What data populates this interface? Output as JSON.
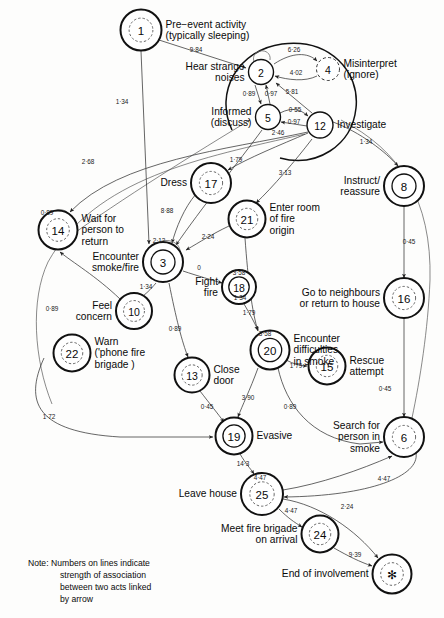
{
  "figure": {
    "note_label": "Note:",
    "note_lines": [
      "Numbers on lines indicate",
      "strength of association",
      "between two acts linked",
      "by arrow"
    ]
  },
  "nodes": [
    {
      "id": "1",
      "num": "1",
      "label": "Pre−event activity\n(typically sleeping)",
      "label_lines": [
        "Pre−event activity",
        "(typically sleeping)"
      ],
      "cx": 141,
      "cy": 30,
      "r": 20.5,
      "style": "double-dashed",
      "label_pos": "right"
    },
    {
      "id": "2",
      "num": "2",
      "label": "Hear strange noises",
      "label_lines": [
        "Hear strange",
        "noises"
      ],
      "cx": 261,
      "cy": 72,
      "r": 12.5,
      "style": "plain",
      "label_pos": "left"
    },
    {
      "id": "4",
      "num": "4",
      "label": "Misinterpret (ignore)",
      "label_lines": [
        "Misinterpret",
        "(ignore)"
      ],
      "cx": 328,
      "cy": 69,
      "r": 11.5,
      "style": "dashed",
      "label_pos": "right"
    },
    {
      "id": "5",
      "num": "5",
      "label": "Informed (discuss)",
      "label_lines": [
        "Informed",
        "(discuss)"
      ],
      "cx": 268,
      "cy": 117,
      "r": 12.5,
      "style": "plain",
      "label_pos": "left"
    },
    {
      "id": "12",
      "num": "12",
      "label": "Investigate",
      "label_lines": [
        "Investigate"
      ],
      "cx": 320,
      "cy": 125,
      "r": 13.0,
      "style": "plain",
      "label_pos": "right"
    },
    {
      "id": "8",
      "num": "8",
      "label": "Instruct/ reassure",
      "label_lines": [
        "Instruct/",
        "reassure"
      ],
      "cx": 404,
      "cy": 186,
      "r": 20.0,
      "style": "double",
      "label_pos": "left"
    },
    {
      "id": "17",
      "num": "17",
      "label": "Dress",
      "label_lines": [
        "Dress"
      ],
      "cx": 211,
      "cy": 183,
      "r": 20.0,
      "style": "double-dashed",
      "label_pos": "left"
    },
    {
      "id": "21",
      "num": "21",
      "label": "Enter room of fire origin",
      "label_lines": [
        "Enter room",
        "of  fire",
        "origin"
      ],
      "cx": 247,
      "cy": 219,
      "r": 18.5,
      "style": "double-dashed",
      "label_pos": "right"
    },
    {
      "id": "14",
      "num": "14",
      "label": "Wait for person to return",
      "label_lines": [
        "Wait for",
        "person to",
        "return"
      ],
      "cx": 58,
      "cy": 230,
      "r": 19.5,
      "style": "double-dashed",
      "label_pos": "right"
    },
    {
      "id": "3",
      "num": "3",
      "label": "Encounter smoke/fire",
      "label_lines": [
        "Encounter",
        "smoke/fire"
      ],
      "cx": 163,
      "cy": 262,
      "r": 20.0,
      "style": "double",
      "label_pos": "left"
    },
    {
      "id": "18",
      "num": "18",
      "label": "Fight fire",
      "label_lines": [
        "Fight",
        "fire"
      ],
      "cx": 239,
      "cy": 287,
      "r": 17.0,
      "style": "double",
      "label_pos": "left"
    },
    {
      "id": "10",
      "num": "10",
      "label": "Feel concern",
      "label_lines": [
        "Feel",
        "concern"
      ],
      "cx": 134,
      "cy": 311,
      "r": 18.0,
      "style": "double-dashed",
      "label_pos": "left"
    },
    {
      "id": "16",
      "num": "16",
      "label": "Go to neighbours or return to house",
      "label_lines": [
        "Go to neighbours",
        "or return  to house"
      ],
      "cx": 404,
      "cy": 298,
      "r": 20.0,
      "style": "double-dashed",
      "label_pos": "left"
    },
    {
      "id": "22",
      "num": "22",
      "label": "Warn ('phone fire brigade )",
      "label_lines": [
        "Warn",
        "('phone fire",
        "brigade )"
      ],
      "cx": 72,
      "cy": 353,
      "r": 18.5,
      "style": "double-dashed",
      "label_pos": "right"
    },
    {
      "id": "20",
      "num": "20",
      "label": "Encounter difficulties in smoke",
      "label_lines": [
        "Encounter",
        "difficulties",
        "in smoke"
      ],
      "cx": 270,
      "cy": 350,
      "r": 19.5,
      "style": "double",
      "label_pos": "right"
    },
    {
      "id": "15",
      "num": "15",
      "label": "Rescue attempt",
      "label_lines": [
        "Rescue",
        "attempt"
      ],
      "cx": 327,
      "cy": 366,
      "r": 18.5,
      "style": "double-dashed",
      "label_pos": "right"
    },
    {
      "id": "13",
      "num": "13",
      "label": "Close door",
      "label_lines": [
        "Close",
        "door"
      ],
      "cx": 192,
      "cy": 375,
      "r": 17.5,
      "style": "double-dashed",
      "label_pos": "right"
    },
    {
      "id": "6",
      "num": "6",
      "label": "Search for person in smoke",
      "label_lines": [
        "Search for",
        "person in",
        "smoke"
      ],
      "cx": 404,
      "cy": 437,
      "r": 20.0,
      "style": "double-dashed",
      "label_pos": "left"
    },
    {
      "id": "19",
      "num": "19",
      "label": "Evasive",
      "label_lines": [
        "Evasive"
      ],
      "cx": 234,
      "cy": 436,
      "r": 18.5,
      "style": "double",
      "label_pos": "right"
    },
    {
      "id": "25",
      "num": "25",
      "label": "Leave house",
      "label_lines": [
        "Leave house"
      ],
      "cx": 262,
      "cy": 494,
      "r": 21.0,
      "style": "double-dashed",
      "label_pos": "left"
    },
    {
      "id": "24",
      "num": "24",
      "label": "Meet fire brigade on arrival",
      "label_lines": [
        "Meet fire brigade",
        "on arrival"
      ],
      "cx": 320,
      "cy": 534,
      "r": 18.5,
      "style": "double-dashed",
      "label_pos": "left"
    },
    {
      "id": "star",
      "num": "✻",
      "label": "End of involvement",
      "label_lines": [
        "End of involvement"
      ],
      "cx": 392,
      "cy": 574,
      "r": 19.5,
      "style": "double-dashed",
      "label_pos": "left"
    }
  ],
  "edges": [
    {
      "from": "1",
      "to": "2",
      "weight": "9·84",
      "wx": 196,
      "wy": 52
    },
    {
      "from": "2",
      "to": "4",
      "weight": "6·26",
      "wx": 294,
      "wy": 52
    },
    {
      "from": "4",
      "to": "2",
      "weight": "4·02",
      "wx": 296,
      "wy": 75
    },
    {
      "from": "2",
      "to": "5",
      "weight": "0·89",
      "wx": 249,
      "wy": 96
    },
    {
      "from": "5",
      "to": "2",
      "weight": "0·97",
      "wx": 271,
      "wy": 96
    },
    {
      "from": "12",
      "to": "2",
      "weight": "5·81",
      "wx": 292,
      "wy": 94
    },
    {
      "from": "5",
      "to": "12",
      "weight": "0·55",
      "wx": 295,
      "wy": 112
    },
    {
      "from": "12",
      "to": "5",
      "weight": "0·97",
      "wx": 294,
      "wy": 124
    },
    {
      "from": "5",
      "to": "3",
      "weight": "2·46",
      "wx": 278,
      "wy": 135
    },
    {
      "from": "1",
      "to": "3",
      "weight": "1·34",
      "wx": 122,
      "wy": 104
    },
    {
      "from": "12",
      "to": "8",
      "weight": "1·34",
      "wx": 366,
      "wy": 144
    },
    {
      "from": "8",
      "to": "16",
      "weight": "0·45",
      "wx": 409,
      "wy": 244
    },
    {
      "from": "12",
      "to": "17",
      "weight": "1·79",
      "wx": 236,
      "wy": 162
    },
    {
      "from": "12",
      "to": "21",
      "weight": "3·13",
      "wx": 285,
      "wy": 175
    },
    {
      "from": "12",
      "to": "14",
      "weight": "2·68",
      "wx": 88,
      "wy": 164
    },
    {
      "from": "17",
      "to": "3",
      "weight": "8·88",
      "wx": 167,
      "wy": 213
    },
    {
      "from": "21",
      "to": "3",
      "weight": "2·24",
      "wx": 208,
      "wy": 239
    },
    {
      "from": "3",
      "to": "18",
      "weight": "0",
      "wx": 199,
      "wy": 270
    },
    {
      "from": "3",
      "to": "10",
      "weight": "1·34",
      "wx": 146,
      "wy": 289
    },
    {
      "from": "3",
      "to": "13",
      "weight": "0·89",
      "wx": 175,
      "wy": 331
    },
    {
      "from": "10",
      "to": "14",
      "weight": "0·89",
      "wx": 52,
      "wy": 311
    },
    {
      "from": "22",
      "to": "19",
      "weight": "1·72",
      "wx": 49,
      "wy": 419
    },
    {
      "from": "21",
      "to": "20",
      "weight": "1·34",
      "wx": 240,
      "wy": 300
    },
    {
      "from": "18",
      "to": "20",
      "weight": "1·79",
      "wx": 249,
      "wy": 315
    },
    {
      "from": "20",
      "to": "15",
      "weight": "1·79",
      "wx": 296,
      "wy": 368
    },
    {
      "from": "20",
      "to": "19",
      "weight": "3·90",
      "wx": 248,
      "wy": 400
    },
    {
      "from": "20",
      "to": "6",
      "weight": "0·89",
      "wx": 290,
      "wy": 409
    },
    {
      "from": "16",
      "to": "6",
      "weight": "0·45",
      "wx": 385,
      "wy": 391
    },
    {
      "from": "13",
      "to": "19",
      "weight": "0·45",
      "wx": 207,
      "wy": 409
    },
    {
      "from": "19",
      "to": "25",
      "weight": "14·3",
      "wx": 243,
      "wy": 466
    },
    {
      "from": "25",
      "to": "6",
      "weight": "4·47",
      "wx": 384,
      "wy": 481
    },
    {
      "from": "6",
      "to": "25",
      "weight": "4·47",
      "wx": 384,
      "wy": 481
    },
    {
      "from": "25",
      "to": "24",
      "weight": "4·47",
      "wx": 291,
      "wy": 513
    },
    {
      "from": "25",
      "to": "star",
      "weight": "2·24",
      "wx": 347,
      "wy": 509
    },
    {
      "from": "24",
      "to": "star",
      "weight": "9·39",
      "wx": 355,
      "wy": 557
    }
  ],
  "self_loops": [
    {
      "node": "2",
      "weight": ""
    },
    {
      "node": "14",
      "weight": "0·89",
      "wx": 47,
      "wy": 215
    },
    {
      "node": "3",
      "weight": "2·12",
      "wx": 159,
      "wy": 243
    },
    {
      "node": "18",
      "weight": "3·58",
      "wx": 239,
      "wy": 275
    },
    {
      "node": "20",
      "weight": "3·58",
      "wx": 265,
      "wy": 336
    },
    {
      "node": "25",
      "weight": "4·47",
      "wx": 260,
      "wy": 480
    }
  ],
  "colors": {
    "background": "#fdfdfc",
    "stroke": "#111111",
    "edge": "#333333",
    "text": "#0a0a0a"
  }
}
